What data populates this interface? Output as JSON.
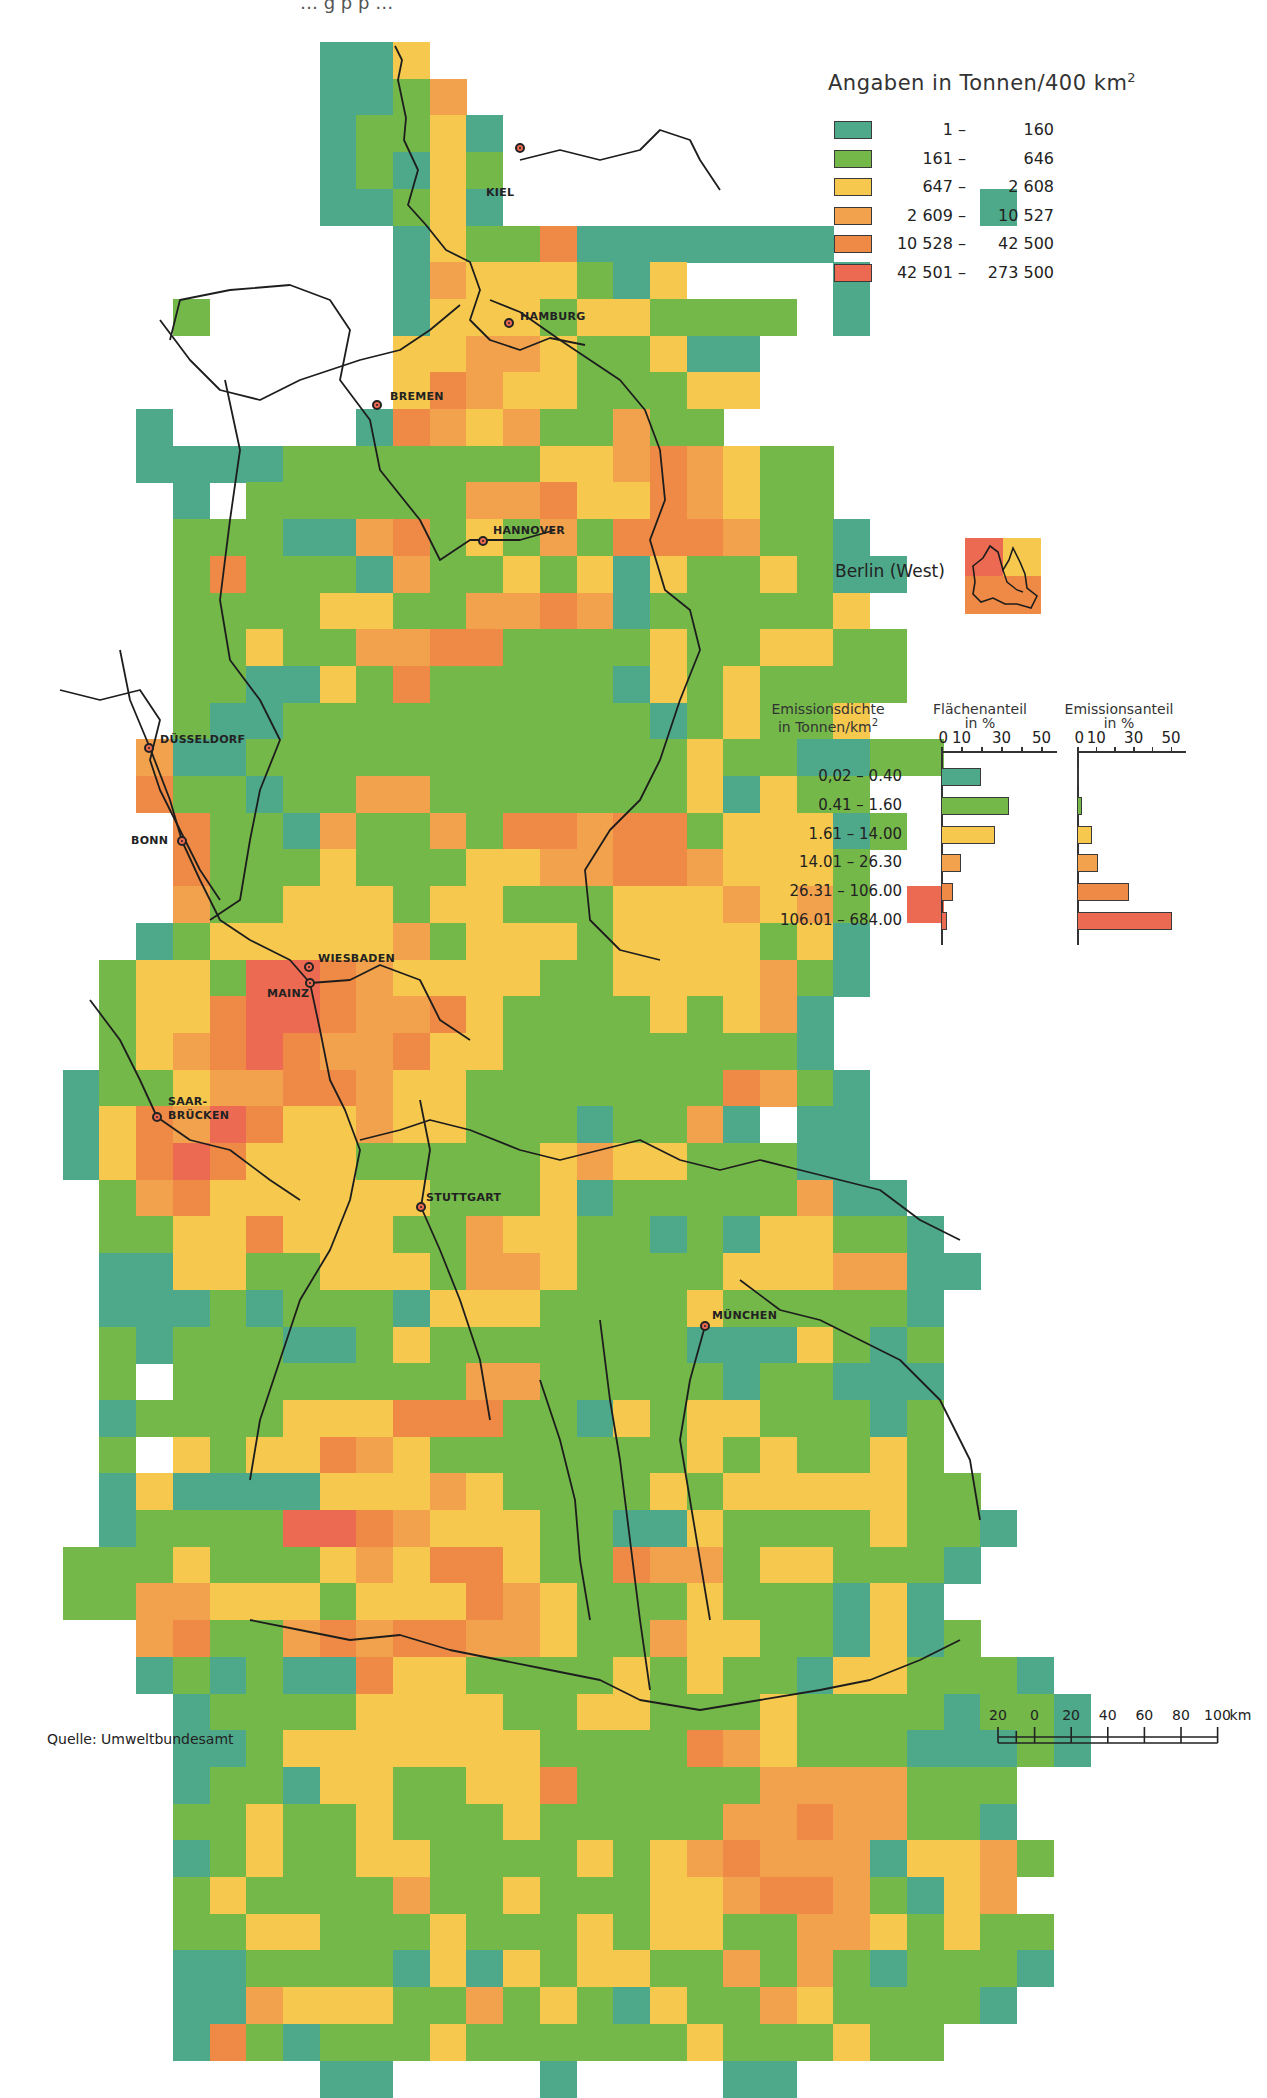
{
  "top_fragment": "… g p p …",
  "legend": {
    "title": "Angaben in Tonnen/400 km",
    "title_sup": "2",
    "classes": [
      {
        "id": 1,
        "from": "1 –",
        "to": "160",
        "color": "#4ea88a"
      },
      {
        "id": 2,
        "from": "161 –",
        "to": "646",
        "color": "#74b84a"
      },
      {
        "id": 3,
        "from": "647 –",
        "to": "2 608",
        "color": "#f6c94e"
      },
      {
        "id": 4,
        "from": "2 609 –",
        "to": "10 527",
        "color": "#f2a24c"
      },
      {
        "id": 5,
        "from": "10 528 –",
        "to": "42 500",
        "color": "#ee8a45"
      },
      {
        "id": 6,
        "from": "42 501 –",
        "to": "273 500",
        "color": "#ec6a52"
      }
    ]
  },
  "berlin": {
    "label": "Berlin (West)"
  },
  "cities": [
    {
      "name": "KIEL",
      "x": 520,
      "y": 148,
      "lx": 486,
      "ly": 186
    },
    {
      "name": "HAMBURG",
      "x": 509,
      "y": 323,
      "lx": 520,
      "ly": 310
    },
    {
      "name": "BREMEN",
      "x": 377,
      "y": 405,
      "lx": 390,
      "ly": 390
    },
    {
      "name": "HANNOVER",
      "x": 483,
      "y": 541,
      "lx": 493,
      "ly": 524
    },
    {
      "name": "DÜSSELDORF",
      "x": 149,
      "y": 748,
      "lx": 160,
      "ly": 733
    },
    {
      "name": "BONN",
      "x": 182,
      "y": 841,
      "lx": 131,
      "ly": 834
    },
    {
      "name": "WIESBADEN",
      "x": 309,
      "y": 967,
      "lx": 318,
      "ly": 952
    },
    {
      "name": "MAINZ",
      "x": 310,
      "y": 983,
      "lx": 267,
      "ly": 987
    },
    {
      "name": "SAAR-",
      "x": 157,
      "y": 1117,
      "lx": 168,
      "ly": 1095
    },
    {
      "name": "BRÜCKEN",
      "x": null,
      "y": null,
      "lx": 168,
      "ly": 1109
    },
    {
      "name": "STUTTGART",
      "x": 421,
      "y": 1207,
      "lx": 426,
      "ly": 1191
    },
    {
      "name": "MÜNCHEN",
      "x": 705,
      "y": 1326,
      "lx": 712,
      "ly": 1309
    }
  ],
  "chart_data": {
    "type": "bar",
    "categories": [
      "0,02 – 0.40",
      "0.41 – 1.60",
      "1.61 – 14.00",
      "14.01 – 26.30",
      "26.31 – 106.00",
      "106.01 – 684.00"
    ],
    "category_colors": [
      "#4ea88a",
      "#74b84a",
      "#f6c94e",
      "#f2a24c",
      "#ee8a45",
      "#ec6a52"
    ],
    "series": [
      {
        "name": "Flächenanteil in %",
        "values": [
          20,
          34,
          27,
          10,
          6,
          3
        ]
      },
      {
        "name": "Emissionsanteil in %",
        "values": [
          0.5,
          2.5,
          8,
          11,
          28,
          51
        ]
      }
    ],
    "xlabel": "in %",
    "ticks": [
      "0",
      "10",
      "30",
      "50"
    ],
    "xlim": [
      0,
      55
    ],
    "orientation": "horizontal",
    "headers": {
      "density_line1": "Emissionsdichte",
      "density_line2": "in Tonnen/km",
      "density_sup": "2",
      "area_line1": "Flächenanteil",
      "area_line2": "in %",
      "emission_line1": "Emissionsanteil",
      "emission_line2": "in %"
    }
  },
  "scale": {
    "labels": [
      "20",
      "0",
      "20",
      "40",
      "60",
      "80",
      "100"
    ],
    "unit": "km"
  },
  "source": "Quelle: Umweltbundesamt",
  "grid": {
    "x0": 26,
    "y0": 42,
    "cell": 36.7,
    "rows": [
      "........113.................",
      "........1124................",
      "........12231...............",
      "........12132...............",
      "........11231.............1.",
      "..........132251111111......",
      "..........14333213....1.....",
      "....2.....13332332222.1.....",
      "..........3344322311........",
      "..........3543322233........",
      "...1.....1543422422.........",
      "...1111222222233454322......",
      "....1.2222224453354322......",
      "....2221145232425554221.....",
      "....25222142232313223211....",
      "....2222332244541222223.....",
      "....22322445522223223322....",
      "....22113252222213232222....",
      "....2112222222222123223.....",
      "...4112222222222223221122...",
      "...52212244222222231322.....",
      "....52214224255455233312....",
      "....5222322233445543332.....",
      "....4223332332223334342.6...",
      "...12333334233323333231.....",
      "..233266543333223333421.....",
      "..23356654453222232341......",
      "..23456544533222222221......",
      ".1223445543322222225421.....",
      ".1354653343322212241.11.....",
      ".1356533322222343322211.....",
      "..2453333332223122222411....",
      "..22335333224332212133221...",
      "..113322333244322223334411..",
      "..11121222133322223222221...",
      "..21222112322222221113212...",
      "..2.222222224422222122111.....",
      "..12222333555221323322212.....",
      "..2.323354322222223232232.....",
      "..131111333432222323333322...",
      "..1222266543332211322223221..",
      ".2223222343553225442332221..",
      ".224433323335432223222131....",
      "...45224545544322433221312...",
      "...1212115332222323221332221",
      "....1222233332233222322221221",
      "....1123333333222254322211121",
      "....12213322335222224444222..",
      "....22322322232222244544221..",
      "....123223322223234544413342.",
      "....23222242232223345542134...",
      "....223322232223233224432322..",
      "....112222131323322424212221..",
      "....11433322423213224322221...",
      "....152122232222223222322.....",
      "........11....1....11........."
    ]
  }
}
